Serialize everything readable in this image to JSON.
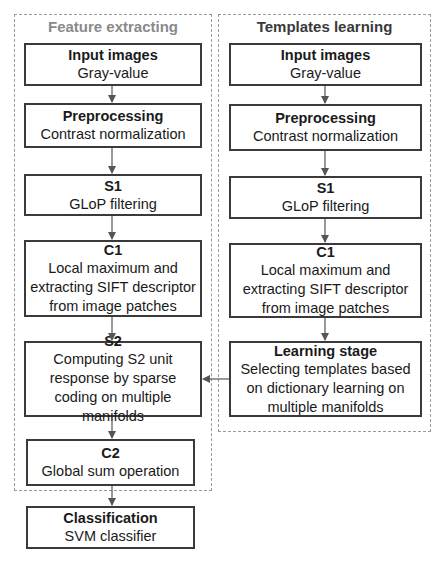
{
  "panels": {
    "left": {
      "title": "Feature extracting",
      "title_color": "#8a8a8a"
    },
    "right": {
      "title": "Templates learning",
      "title_color": "#3a3a3a"
    }
  },
  "left_boxes": [
    {
      "title": "Input images",
      "desc": "Gray-value"
    },
    {
      "title": "Preprocessing",
      "desc": "Contrast normalization"
    },
    {
      "title": "S1",
      "desc": "GLoP filtering"
    },
    {
      "title": "C1",
      "desc": "Local maximum and extracting SIFT descriptor from image patches"
    },
    {
      "title": "S2",
      "desc": "Computing S2 unit response by sparse coding on multiple manifolds"
    },
    {
      "title": "C2",
      "desc": "Global sum operation"
    }
  ],
  "right_boxes": [
    {
      "title": "Input images",
      "desc": "Gray-value"
    },
    {
      "title": "Preprocessing",
      "desc": "Contrast normalization"
    },
    {
      "title": "S1",
      "desc": "GLoP filtering"
    },
    {
      "title": "C1",
      "desc": "Local maximum and extracting SIFT descriptor from image patches"
    },
    {
      "title": "Learning stage",
      "desc": "Selecting templates based on dictionary learning on multiple manifolds"
    }
  ],
  "output_box": {
    "title": "Classification",
    "desc": "SVM classifier"
  },
  "colors": {
    "box_border": "#3a3a3a",
    "dashed_border": "#9a9a9a",
    "arrow": "#555555"
  }
}
